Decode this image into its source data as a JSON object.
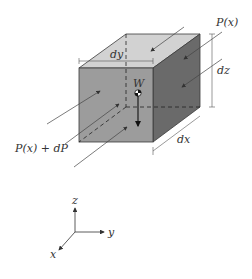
{
  "diagram": {
    "type": "3D fluid element free-body diagram",
    "labels": {
      "p_top": "P(x)",
      "p_bottom": "P(x) + dP",
      "dy": "dy",
      "dz": "dz",
      "dx": "dx",
      "weight": "W"
    },
    "axes": {
      "z": "z",
      "y": "y",
      "x": "x"
    },
    "colors": {
      "front_face": "#9c9c9c",
      "top_face": "#d2d2d2",
      "right_face": "#6a6a6a",
      "edge": "#3a3a3a",
      "line": "#444444"
    }
  }
}
